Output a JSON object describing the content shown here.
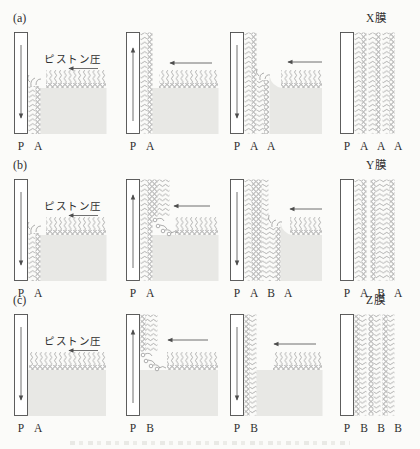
{
  "figure": {
    "description_visible_text_only": true,
    "colors": {
      "background": "#fbfbf9",
      "ink": "#2f2f2f",
      "molecule_stroke": "#8d8d8d",
      "water_fill": "#e8e8e5"
    },
    "rows": [
      {
        "tag": "(a)",
        "piston_label": "ピストン圧",
        "piston_arrow": "left",
        "film_title": "X膜",
        "panels": [
          {
            "labels": [
              "P",
              "A"
            ],
            "plate_motion": "down"
          },
          {
            "labels": [
              "P",
              "A"
            ],
            "plate_motion": "up",
            "surface_arrow": "left"
          },
          {
            "labels": [
              "P",
              "A",
              "A"
            ],
            "plate_motion": "down",
            "surface_arrow": "left"
          },
          {
            "labels": [
              "P",
              "A",
              "A",
              "A"
            ],
            "plate_motion": "none"
          }
        ]
      },
      {
        "tag": "(b)",
        "piston_label": "ピストン圧",
        "piston_arrow": "left",
        "film_title": "Y膜",
        "panels": [
          {
            "labels": [
              "P",
              "A"
            ],
            "plate_motion": "down"
          },
          {
            "labels": [
              "P",
              "A"
            ],
            "plate_motion": "up",
            "surface_arrow": "left"
          },
          {
            "labels": [
              "P",
              "A",
              "B",
              "A"
            ],
            "plate_motion": "down",
            "surface_arrow": "left"
          },
          {
            "labels": [
              "P",
              "A",
              "B",
              "A"
            ],
            "plate_motion": "none"
          }
        ]
      },
      {
        "tag": "(c)",
        "piston_label": "ピストン圧",
        "piston_arrow": "left",
        "film_title": "Z膜",
        "panels": [
          {
            "labels": [
              "P",
              "A"
            ],
            "plate_motion": "down"
          },
          {
            "labels": [
              "P",
              "B"
            ],
            "plate_motion": "up",
            "surface_arrow": "left"
          },
          {
            "labels": [
              "P",
              "B"
            ],
            "plate_motion": "down",
            "surface_arrow": "left"
          },
          {
            "labels": [
              "P",
              "B",
              "B",
              "B"
            ],
            "plate_motion": "none"
          }
        ]
      }
    ]
  }
}
